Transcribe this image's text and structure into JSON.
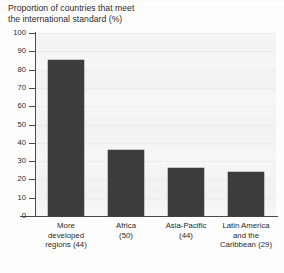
{
  "chart_data": {
    "type": "bar",
    "title": "Proportion of countries that meet\nthe international standard (%)",
    "xlabel": "",
    "ylabel": "",
    "ylim": [
      0,
      100
    ],
    "yticks": [
      0,
      10,
      20,
      30,
      40,
      50,
      60,
      70,
      80,
      90,
      100
    ],
    "grid": true,
    "legend": "none",
    "bar_color": "#3c3c3c",
    "categories": [
      "More\ndeveloped\nregions (44)",
      "Africa\n(50)",
      "Asia-Pacific\n(44)",
      "Latin America\nand the\nCaribbean (29)"
    ],
    "category_names": [
      "More developed regions",
      "Africa",
      "Asia-Pacific",
      "Latin America and the Caribbean"
    ],
    "sample_sizes": [
      44,
      50,
      44,
      29
    ],
    "values": [
      85,
      36,
      26,
      24
    ]
  }
}
